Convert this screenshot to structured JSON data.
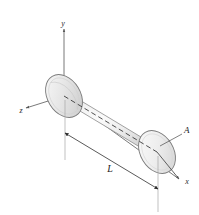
{
  "figure": {
    "background_color": "#ffffff"
  },
  "axes": {
    "y": {
      "label": "y",
      "tip_x": 63,
      "tip_y": 26,
      "origin_x": 64,
      "origin_y": 96
    },
    "z": {
      "label": "z",
      "tip_x": 22,
      "tip_y": 110,
      "origin_x": 64,
      "origin_y": 96
    },
    "x": {
      "label": "x",
      "tip_x": 182,
      "tip_y": 181,
      "origin_x": 64,
      "origin_y": 96
    },
    "axis_color": "#555555"
  },
  "annotations": {
    "length": {
      "label": "L",
      "x": 110,
      "y": 170
    },
    "area": {
      "label": "A",
      "x": 185,
      "y": 131
    }
  },
  "cylinder": {
    "body_fill_light": "#fbfbfb",
    "body_fill_mid": "#e2e2e2",
    "body_fill_dark": "#c9c9c9",
    "cap_fill": "#efefef",
    "outline_color": "#6e6e6e",
    "center_line_style": "dashed",
    "center_line_color": "#3b3b3b"
  },
  "dimension": {
    "line_color": "#3a3a3a",
    "extension_color": "#9a9a9a",
    "arrow_style": "filled-triangle"
  }
}
